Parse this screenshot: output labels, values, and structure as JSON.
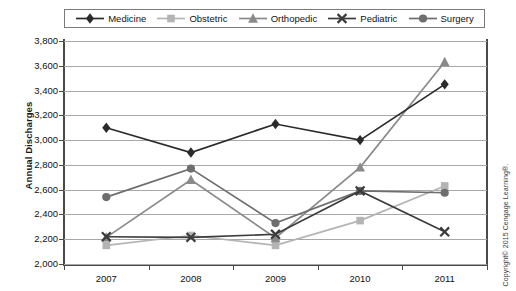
{
  "figure": {
    "y_axis_title": "Annual Discharges",
    "copyright": "Copyright© 2015 Cengage Learning®."
  },
  "legend": {
    "items": [
      {
        "label": "Medicine",
        "marker": "diamond-marker",
        "color": "#2b2b2b"
      },
      {
        "label": "Obstetric",
        "marker": "square-marker",
        "color": "#b4b4b4"
      },
      {
        "label": "Orthopedic",
        "marker": "triangle-marker",
        "color": "#8a8a8a"
      },
      {
        "label": "Pediatric",
        "marker": "x-marker",
        "color": "#3c3c3c"
      },
      {
        "label": "Surgery",
        "marker": "circle-marker",
        "color": "#6e6e6e"
      }
    ]
  },
  "axes": {
    "y_ticks": [
      "3,800",
      "3,600",
      "3,400",
      "3,200",
      "3,000",
      "2,800",
      "2,600",
      "2,400",
      "2,200",
      "2,000"
    ],
    "x_ticks": [
      "2007",
      "2008",
      "2009",
      "2010",
      "2011"
    ]
  },
  "chart_data": {
    "type": "line",
    "title": "",
    "xlabel": "",
    "ylabel": "Annual Discharges",
    "categories": [
      "2007",
      "2008",
      "2009",
      "2010",
      "2011"
    ],
    "ylim": [
      2000,
      3800
    ],
    "ytick_step": 200,
    "grid": true,
    "legend_position": "top",
    "series": [
      {
        "name": "Medicine",
        "color": "#2b2b2b",
        "marker": "diamond",
        "values": [
          3100,
          2900,
          3130,
          3000,
          3450
        ]
      },
      {
        "name": "Obstetric",
        "color": "#b4b4b4",
        "marker": "square",
        "values": [
          2150,
          2230,
          2150,
          2350,
          2630
        ]
      },
      {
        "name": "Orthopedic",
        "color": "#8a8a8a",
        "marker": "triangle",
        "values": [
          2215,
          2680,
          2210,
          2780,
          3630
        ]
      },
      {
        "name": "Pediatric",
        "color": "#3c3c3c",
        "marker": "x",
        "values": [
          2220,
          2215,
          2240,
          2590,
          2260
        ]
      },
      {
        "name": "Surgery",
        "color": "#6e6e6e",
        "marker": "circle",
        "values": [
          2540,
          2770,
          2330,
          2590,
          2575
        ]
      }
    ]
  }
}
